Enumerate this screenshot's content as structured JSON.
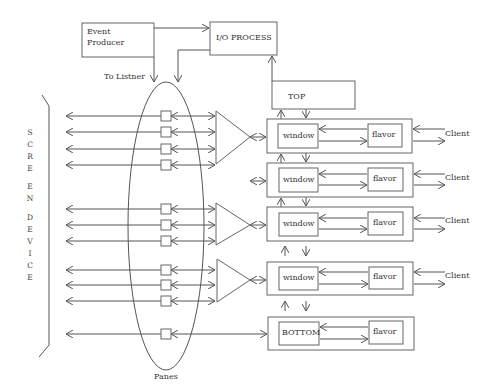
{
  "diagram": {
    "nodes": {
      "event_producer": {
        "line1": "Event",
        "line2": "Producer"
      },
      "io_process": {
        "label": "I/O PROCESS"
      },
      "top": {
        "label": "TOP"
      },
      "bottom": {
        "label": "BOTTOM"
      }
    },
    "window_label": "window",
    "flavor_label": "flavor",
    "client_label": "Client",
    "to_listner_label": "To Listner",
    "panes_label": "Panes",
    "screen_device": {
      "letters_1": [
        "S",
        "C",
        "R",
        "E"
      ],
      "letters_2": [
        "E",
        "N"
      ],
      "letters_3": [
        "D",
        "E",
        "V",
        "I",
        "C",
        "E"
      ]
    },
    "layers": [
      {
        "left": "window",
        "right": "flavor",
        "client": "Client"
      },
      {
        "left": "window",
        "right": "flavor",
        "client": "Client"
      },
      {
        "left": "window",
        "right": "flavor",
        "client": "Client"
      },
      {
        "left": "window",
        "right": "flavor",
        "client": "Client"
      },
      {
        "left": "BOTTOM",
        "right": "flavor",
        "client": ""
      }
    ],
    "colors": {
      "line": "#555555",
      "background": "#ffffff",
      "text": "#333333"
    }
  }
}
